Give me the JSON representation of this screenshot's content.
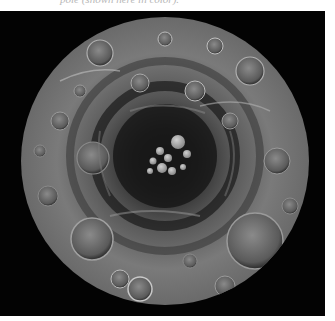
{
  "caption": {
    "text": "pole (shown here in color)."
  },
  "figure": {
    "background_color": "#030303",
    "disk": {
      "cx": 165,
      "cy": 150,
      "r": 144
    },
    "colors": {
      "surface_light": "#9a9a9a",
      "surface_mid": "#6e6e6e",
      "surface_dark": "#2c2c2c",
      "shadow": "#0c0c0c",
      "highlight": "#d8d8d8"
    }
  }
}
